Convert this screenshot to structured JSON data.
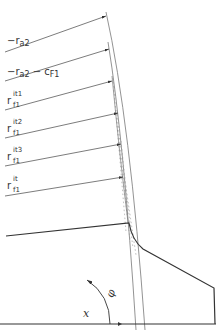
{
  "diagram": {
    "labels": [
      {
        "id": "ra2",
        "main": "−r",
        "sub": "a2",
        "sup": "",
        "suffix": ""
      },
      {
        "id": "ra2-cf1",
        "main": "−r",
        "sub": "a2",
        "sup": "",
        "suffix": " − c",
        "suffix_sub": "F1"
      },
      {
        "id": "rf1-it1",
        "main": "r",
        "sub": "f1",
        "sup": "it1"
      },
      {
        "id": "rf1-it2",
        "main": "r",
        "sub": "f1",
        "sup": "it2"
      },
      {
        "id": "rf1-it3",
        "main": "r",
        "sub": "f1",
        "sup": "it3"
      },
      {
        "id": "rf1-it",
        "main": "r",
        "sub": "f1",
        "sup": "it"
      }
    ],
    "axis_label_x": "x",
    "angle_label": "φ",
    "colors": {
      "line": "#333333",
      "thin": "#777777",
      "dotted": "#999999"
    }
  }
}
